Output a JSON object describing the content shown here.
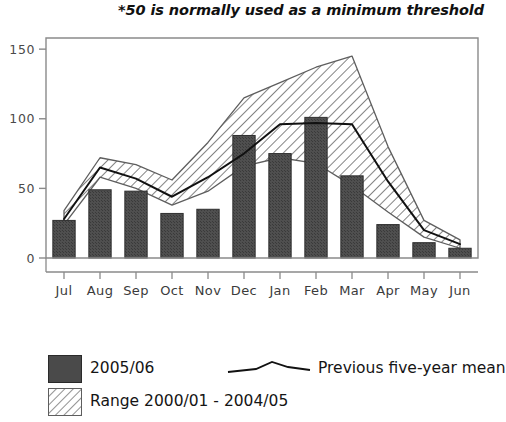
{
  "note": "*50 is normally used as a minimum threshold",
  "axes": {
    "y_ticks": [
      "0",
      "50",
      "100",
      "150"
    ],
    "y_tick_values": [
      0,
      50,
      100,
      150
    ],
    "ylim": [
      0,
      158
    ],
    "x_ticks": [
      "Jul",
      "Aug",
      "Sep",
      "Oct",
      "Nov",
      "Dec",
      "Jan",
      "Feb",
      "Mar",
      "Apr",
      "May",
      "Jun"
    ]
  },
  "legend": {
    "bar_label": "2005/06",
    "line_label": "Previous five-year mean",
    "band_label": "Range 2000/01 - 2004/05",
    "bar_color": "#4a4a4a",
    "line_color": "#111111",
    "band_hatch_color": "#7a7a7a"
  },
  "chart_data": {
    "type": "bar",
    "title": "",
    "subtitle": "*50 is normally used as a minimum threshold",
    "xlabel": "",
    "ylabel": "",
    "ylim": [
      0,
      158
    ],
    "grid": false,
    "legend_position": "bottom",
    "categories": [
      "Jul",
      "Aug",
      "Sep",
      "Oct",
      "Nov",
      "Dec",
      "Jan",
      "Feb",
      "Mar",
      "Apr",
      "May",
      "Jun"
    ],
    "series": [
      {
        "name": "2005/06",
        "type": "bar",
        "values": [
          27,
          49,
          48,
          32,
          35,
          88,
          75,
          101,
          59,
          24,
          11,
          7
        ]
      },
      {
        "name": "Previous five-year mean",
        "type": "line",
        "values": [
          28,
          65,
          57,
          44,
          58,
          75,
          96,
          97,
          96,
          55,
          20,
          10
        ]
      },
      {
        "name": "Range 2000/01 - 2004/05",
        "type": "band",
        "upper": [
          34,
          72,
          67,
          56,
          83,
          115,
          126,
          137,
          145,
          80,
          27,
          13
        ],
        "lower": [
          24,
          58,
          50,
          38,
          48,
          66,
          72,
          68,
          52,
          33,
          15,
          7
        ]
      }
    ]
  }
}
